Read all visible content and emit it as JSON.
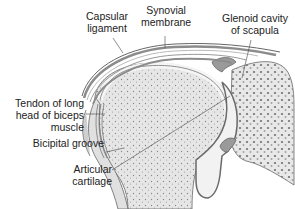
{
  "diagram": {
    "type": "anatomical-cross-section",
    "colors": {
      "background": "#ffffff",
      "bone_fill": "#e4e4e4",
      "bone_dots": "#8a8a8a",
      "cartilage_fill": "#f2f2f2",
      "capsule_dark": "#8c8c8c",
      "outline": "#5a5a5a",
      "text": "#222222"
    },
    "labels": [
      {
        "id": "capsular-ligament",
        "lines": [
          "Capsular",
          "ligament"
        ]
      },
      {
        "id": "synovial-membrane",
        "lines": [
          "Synovial",
          "membrane"
        ]
      },
      {
        "id": "glenoid-cavity",
        "lines": [
          "Glenoid cavity",
          "of scapula"
        ]
      },
      {
        "id": "biceps-tendon",
        "lines": [
          "Tendon of long",
          "head of biceps",
          "muscle"
        ]
      },
      {
        "id": "bicipital-groove",
        "lines": [
          "Bicipital groove"
        ]
      },
      {
        "id": "articular-cartilage",
        "lines": [
          "Articular",
          "cartilage"
        ]
      }
    ]
  }
}
